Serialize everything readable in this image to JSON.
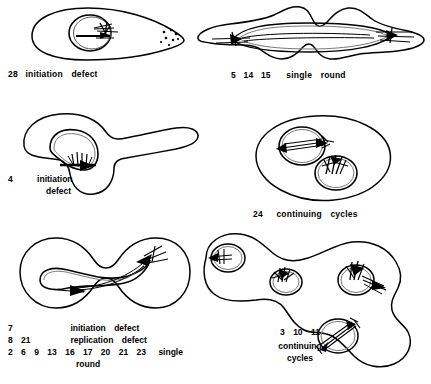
{
  "figure": {
    "ink_color": "#000000",
    "background_color": "#ffffff"
  },
  "panels": [
    {
      "id": "panel-initiation-defect-28",
      "position": "top-left",
      "caption_ids": [
        "28"
      ],
      "caption_words": [
        "initiation",
        "defect"
      ],
      "cell_description": "single pear-shaped cell with one circular chromosome and stippled pole"
    },
    {
      "id": "panel-single-round-5-14-15",
      "position": "top-right",
      "caption_ids": [
        "5",
        "14",
        "15"
      ],
      "caption_words": [
        "single",
        "round"
      ],
      "cell_description": "dumbbell cell with one elongated replicating chromosome spanning both halves"
    },
    {
      "id": "panel-initiation-defect-4",
      "position": "middle-left",
      "caption_ids": [
        "4"
      ],
      "caption_words": [
        "initiation",
        "defect"
      ],
      "cell_description": "filamentous branched cell with one chromosome at the junction"
    },
    {
      "id": "panel-continuing-cycles-24",
      "position": "middle-right",
      "caption_ids": [
        "24"
      ],
      "caption_words": [
        "continuing",
        "cycles"
      ],
      "cell_description": "ovoid cell containing two chromosomes, one replicating and one with a fork"
    },
    {
      "id": "panel-bottom-left-multi",
      "position": "bottom-left",
      "caption_lines": [
        {
          "ids": [
            "7"
          ],
          "words": [
            "initiation",
            "defect"
          ]
        },
        {
          "ids": [
            "8",
            "21"
          ],
          "words": [
            "replication",
            "defect"
          ]
        },
        {
          "ids": [
            "2",
            "6",
            "9",
            "13",
            "16",
            "17",
            "20",
            "21",
            "23"
          ],
          "words": [
            "single"
          ],
          "words_second_line": [
            "round"
          ]
        }
      ],
      "cell_description": "dividing dumbbell cell with one stretched replicating chromosome"
    },
    {
      "id": "panel-continuing-cycles-3-10-11",
      "position": "bottom-right",
      "caption_ids": [
        "3",
        "10",
        "11"
      ],
      "caption_words": [
        "continuing"
      ],
      "caption_words_second_line": [
        "cycles"
      ],
      "cell_description": "long multi-lobed filament containing four chromosomes at different replication stages"
    }
  ]
}
